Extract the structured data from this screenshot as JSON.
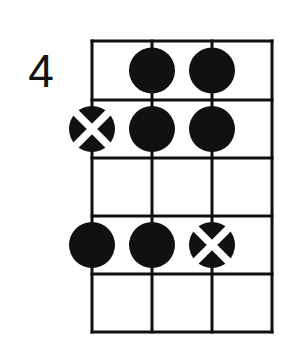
{
  "diagram": {
    "starting_fret_label": "4",
    "background_color": "#ffffff",
    "line_color": "#111111",
    "dot_fill_color": "#111111",
    "cross_color": "#ffffff",
    "string_count": 4,
    "fret_count": 5,
    "grid": {
      "left": 92,
      "top": 41,
      "right": 272,
      "bottom": 332,
      "string_x": [
        92,
        152,
        212,
        272
      ],
      "fret_y": [
        41,
        100,
        158,
        216,
        274,
        332
      ]
    },
    "marker_radius": 23,
    "markers": [
      {
        "name": "marker-string2-fret1",
        "string": 2,
        "fret": 1,
        "type": "dot",
        "cx": 152,
        "cy": 70.5
      },
      {
        "name": "marker-string3-fret1",
        "string": 3,
        "fret": 1,
        "type": "dot",
        "cx": 212,
        "cy": 70.5
      },
      {
        "name": "marker-string1-fret2",
        "string": 1,
        "fret": 2,
        "type": "cross",
        "cx": 92,
        "cy": 129
      },
      {
        "name": "marker-string2-fret2",
        "string": 2,
        "fret": 2,
        "type": "dot",
        "cx": 152,
        "cy": 129
      },
      {
        "name": "marker-string3-fret2",
        "string": 3,
        "fret": 2,
        "type": "dot",
        "cx": 212,
        "cy": 129
      },
      {
        "name": "marker-string1-fret4",
        "string": 1,
        "fret": 4,
        "type": "dot",
        "cx": 92,
        "cy": 245
      },
      {
        "name": "marker-string2-fret4",
        "string": 2,
        "fret": 4,
        "type": "dot",
        "cx": 152,
        "cy": 245
      },
      {
        "name": "marker-string3-fret4",
        "string": 3,
        "fret": 4,
        "type": "cross",
        "cx": 212,
        "cy": 245
      }
    ]
  }
}
